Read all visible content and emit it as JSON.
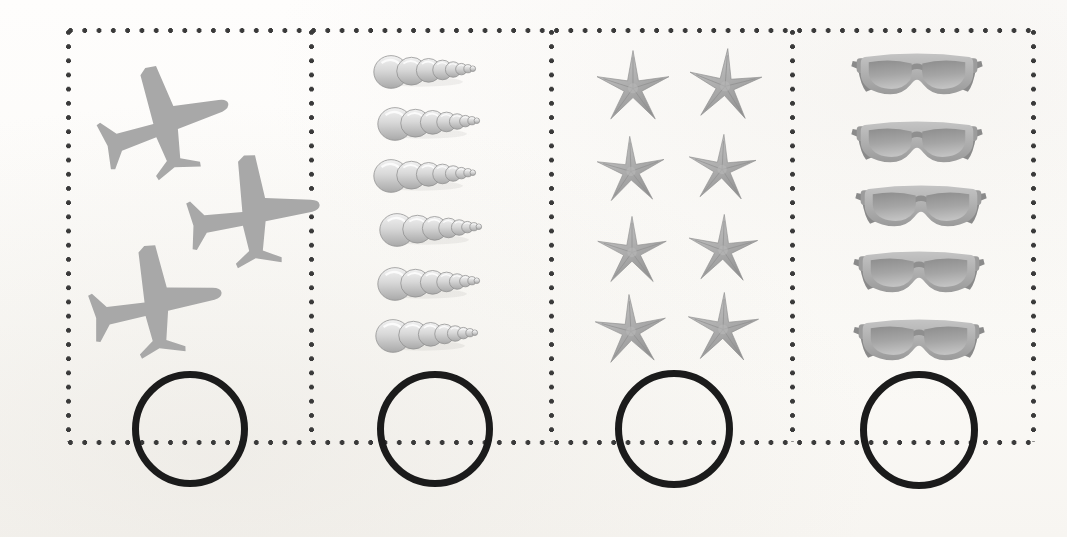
{
  "worksheet": {
    "title": "Count and write the number",
    "background_color": "#fdfcfa",
    "border_color": "#3a3a3a",
    "circle_color": "#1b1b1b",
    "frame": {
      "left": 68,
      "top": 30,
      "right": 1033,
      "bottom": 442
    }
  },
  "cells": [
    {
      "id": "cell-1",
      "item_name": "airplane",
      "item_label": "Airplanes",
      "count": 3,
      "answer_value": "",
      "answer_placeholder": "",
      "item_color": "#a8a8a8",
      "x": 68,
      "width": 243,
      "positions": [
        {
          "x": 28,
          "y": 28,
          "w": 136,
          "h": 118,
          "rot": -18
        },
        {
          "x": 118,
          "y": 118,
          "w": 136,
          "h": 118,
          "rot": -8
        },
        {
          "x": 20,
          "y": 208,
          "w": 136,
          "h": 118,
          "rot": -10
        }
      ],
      "circle": {
        "cx": 190,
        "cy": 429,
        "r": 58
      }
    },
    {
      "id": "cell-2",
      "item_name": "seashell",
      "item_label": "Seashells",
      "count": 6,
      "answer_value": "",
      "answer_placeholder": "",
      "item_color": "#bdbdbd",
      "x": 311,
      "width": 240,
      "positions": [
        {
          "x": 62,
          "y": 22,
          "w": 108,
          "h": 40,
          "rot": 0
        },
        {
          "x": 66,
          "y": 74,
          "w": 108,
          "h": 40,
          "rot": 0
        },
        {
          "x": 62,
          "y": 126,
          "w": 108,
          "h": 40,
          "rot": 0
        },
        {
          "x": 68,
          "y": 180,
          "w": 108,
          "h": 40,
          "rot": 0
        },
        {
          "x": 66,
          "y": 234,
          "w": 108,
          "h": 40,
          "rot": 0
        },
        {
          "x": 64,
          "y": 286,
          "w": 108,
          "h": 40,
          "rot": 0
        }
      ],
      "circle": {
        "cx": 435,
        "cy": 429,
        "r": 58
      }
    },
    {
      "id": "cell-3",
      "item_name": "starfish",
      "item_label": "Starfish",
      "count": 8,
      "answer_value": "",
      "answer_placeholder": "",
      "item_color": "#b2b2b2",
      "x": 551,
      "width": 241,
      "positions": [
        {
          "x": 38,
          "y": 18,
          "w": 88,
          "h": 84,
          "rot": 0
        },
        {
          "x": 130,
          "y": 16,
          "w": 88,
          "h": 84,
          "rot": 4
        },
        {
          "x": 40,
          "y": 104,
          "w": 80,
          "h": 78,
          "rot": -2
        },
        {
          "x": 130,
          "y": 102,
          "w": 82,
          "h": 78,
          "rot": 3
        },
        {
          "x": 38,
          "y": 184,
          "w": 86,
          "h": 80,
          "rot": 0
        },
        {
          "x": 130,
          "y": 182,
          "w": 84,
          "h": 80,
          "rot": 2
        },
        {
          "x": 36,
          "y": 262,
          "w": 88,
          "h": 82,
          "rot": -3
        },
        {
          "x": 128,
          "y": 260,
          "w": 88,
          "h": 82,
          "rot": 2
        }
      ],
      "circle": {
        "cx": 674,
        "cy": 429,
        "r": 59
      }
    },
    {
      "id": "cell-4",
      "item_name": "sunglasses",
      "item_label": "Sunglasses",
      "count": 5,
      "answer_value": "",
      "answer_placeholder": "",
      "item_color": "#9e9e9e",
      "x": 792,
      "width": 241,
      "positions": [
        {
          "x": 58,
          "y": 20,
          "w": 134,
          "h": 62,
          "rot": 0
        },
        {
          "x": 58,
          "y": 88,
          "w": 134,
          "h": 62,
          "rot": 0
        },
        {
          "x": 62,
          "y": 152,
          "w": 134,
          "h": 62,
          "rot": 0
        },
        {
          "x": 60,
          "y": 218,
          "w": 134,
          "h": 62,
          "rot": 0
        },
        {
          "x": 60,
          "y": 286,
          "w": 134,
          "h": 62,
          "rot": 0
        }
      ],
      "circle": {
        "cx": 919,
        "cy": 430,
        "r": 59
      }
    }
  ]
}
